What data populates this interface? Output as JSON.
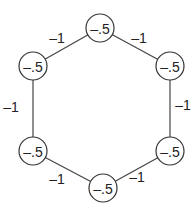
{
  "graph": {
    "type": "cycle",
    "nodes": [
      {
        "id": "top",
        "label": "-.5",
        "x": 100,
        "y": 28
      },
      {
        "id": "upper-right",
        "label": "-.5",
        "x": 170,
        "y": 66
      },
      {
        "id": "lower-right",
        "label": "-.5",
        "x": 170,
        "y": 151
      },
      {
        "id": "bottom",
        "label": "-.5",
        "x": 103,
        "y": 188
      },
      {
        "id": "lower-left",
        "label": "-.5",
        "x": 33,
        "y": 151
      },
      {
        "id": "upper-left",
        "label": "-.5",
        "x": 33,
        "y": 66
      }
    ],
    "edges": [
      {
        "from": "top",
        "to": "upper-right",
        "weight": "-1",
        "lx": 139,
        "ly": 38
      },
      {
        "from": "upper-right",
        "to": "lower-right",
        "weight": "-1",
        "lx": 183,
        "ly": 105
      },
      {
        "from": "lower-right",
        "to": "bottom",
        "weight": "-1",
        "lx": 137,
        "ly": 177
      },
      {
        "from": "bottom",
        "to": "lower-left",
        "weight": "-1",
        "lx": 57,
        "ly": 179
      },
      {
        "from": "lower-left",
        "to": "upper-left",
        "weight": "-1",
        "lx": 11,
        "ly": 107
      },
      {
        "from": "upper-left",
        "to": "top",
        "weight": "-1",
        "lx": 57,
        "ly": 38
      }
    ]
  }
}
